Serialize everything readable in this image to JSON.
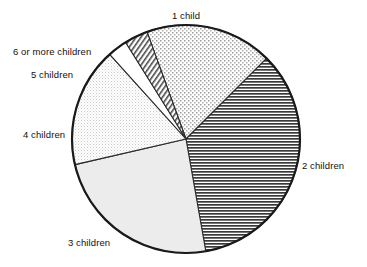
{
  "chart_data": {
    "type": "pie",
    "title": "",
    "subtitle": "",
    "xlabel": "",
    "ylabel": "",
    "legend_position": "none",
    "grid": false,
    "labels_outside": true,
    "categories": [
      "1 child",
      "2 children",
      "3 children",
      "4 children",
      "5 children",
      "6 or more children"
    ],
    "values": [
      17.9,
      34.7,
      24.2,
      17.0,
      2.8,
      3.4
    ],
    "units": "percent",
    "slices": [
      {
        "label": "1 child",
        "value": 17.9,
        "start_angle_deg": 340.0,
        "end_angle_deg": 405.0,
        "fill": "coarse-stipple",
        "fill_color": "#e8e8e8",
        "label_x": 172,
        "label_y": 10
      },
      {
        "label": "2 children",
        "value": 34.7,
        "start_angle_deg": 45.0,
        "end_angle_deg": 170.0,
        "fill": "dense-horizontal-lines",
        "fill_color": "#b0b0b0",
        "label_x": 302,
        "label_y": 160
      },
      {
        "label": "3 children",
        "value": 24.2,
        "start_angle_deg": 170.0,
        "end_angle_deg": 257.0,
        "fill": "solid-light-gray",
        "fill_color": "#ebebeb",
        "label_x": 68,
        "label_y": 237
      },
      {
        "label": "4 children",
        "value": 17.0,
        "start_angle_deg": 257.0,
        "end_angle_deg": 318.0,
        "fill": "fine-cross-hatch",
        "fill_color": "#f4f4f4",
        "label_x": 23,
        "label_y": 129
      },
      {
        "label": "5 children",
        "value": 2.8,
        "start_angle_deg": 318.0,
        "end_angle_deg": 328.0,
        "fill": "white",
        "fill_color": "#ffffff",
        "label_x": 31,
        "label_y": 69
      },
      {
        "label": "6 or more children",
        "value": 3.4,
        "start_angle_deg": 328.0,
        "end_angle_deg": 340.0,
        "fill": "diagonal-hatch",
        "fill_color": "#d8d8d8",
        "label_x": 13,
        "label_y": 46
      }
    ],
    "geometry": {
      "center_x": 186,
      "center_y": 139,
      "radius": 114
    },
    "colors": {
      "outline": "#1a1a1a",
      "divider": "#2a2a2a",
      "background": "#ffffff",
      "text": "#111111"
    }
  },
  "labels": {
    "one_child": "1 child",
    "two_children": "2 children",
    "three_children": "3 children",
    "four_children": "4 children",
    "five_children": "5 children",
    "six_or_more_children": "6 or more children"
  }
}
